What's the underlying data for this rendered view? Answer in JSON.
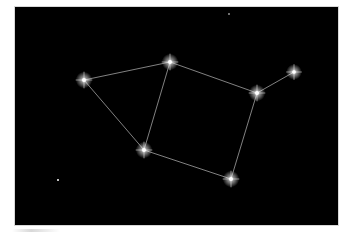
{
  "image": {
    "description": "Constellation photo: bright stars connected by thin lines on a black night sky",
    "background_color": "#000000",
    "line_color": "#bfbfbf",
    "star_color": "#ffffff",
    "frame": {
      "x": 15,
      "y": 7,
      "width": 323,
      "height": 218
    }
  },
  "stars": [
    {
      "id": "A",
      "x": 69,
      "y": 73,
      "r": 3.2
    },
    {
      "id": "B",
      "x": 155,
      "y": 55,
      "r": 3.2
    },
    {
      "id": "C",
      "x": 242,
      "y": 86,
      "r": 3.2
    },
    {
      "id": "D",
      "x": 279,
      "y": 65,
      "r": 3.0
    },
    {
      "id": "E",
      "x": 129,
      "y": 143,
      "r": 3.2
    },
    {
      "id": "F",
      "x": 216,
      "y": 172,
      "r": 3.2
    },
    {
      "id": "faint-1",
      "x": 43,
      "y": 173,
      "r": 1.0
    },
    {
      "id": "faint-2",
      "x": 214,
      "y": 7,
      "r": 0.8
    }
  ],
  "lines": [
    [
      "A",
      "B"
    ],
    [
      "A",
      "E"
    ],
    [
      "B",
      "E"
    ],
    [
      "B",
      "C"
    ],
    [
      "C",
      "D"
    ],
    [
      "C",
      "F"
    ],
    [
      "E",
      "F"
    ]
  ]
}
